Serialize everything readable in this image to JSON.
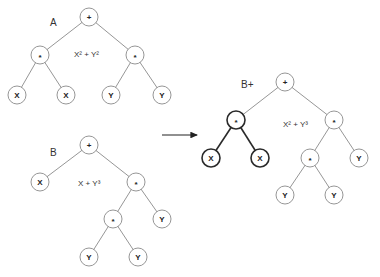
{
  "diagram": {
    "trees": [
      {
        "id": "A",
        "label": "A",
        "label_pos": [
          50,
          26
        ],
        "expression": "X² + Y²",
        "expression_pos": [
          74,
          57
        ],
        "nodes": [
          {
            "id": "a0",
            "text": "+",
            "x": 89,
            "y": 17,
            "bold": false
          },
          {
            "id": "a1",
            "text": "*",
            "x": 40,
            "y": 55,
            "bold": false
          },
          {
            "id": "a2",
            "text": "*",
            "x": 135,
            "y": 55,
            "bold": false
          },
          {
            "id": "a3",
            "text": "X",
            "x": 17,
            "y": 95,
            "bold": false
          },
          {
            "id": "a4",
            "text": "X",
            "x": 66,
            "y": 95,
            "bold": false
          },
          {
            "id": "a5",
            "text": "Y",
            "x": 111,
            "y": 95,
            "bold": false
          },
          {
            "id": "a6",
            "text": "Y",
            "x": 162,
            "y": 95,
            "bold": false
          }
        ],
        "edges": [
          [
            "a0",
            "a1",
            false
          ],
          [
            "a0",
            "a2",
            false
          ],
          [
            "a1",
            "a3",
            false
          ],
          [
            "a1",
            "a4",
            false
          ],
          [
            "a2",
            "a5",
            false
          ],
          [
            "a2",
            "a6",
            false
          ]
        ]
      },
      {
        "id": "B",
        "label": "B",
        "label_pos": [
          50,
          156
        ],
        "expression": "X + Y³",
        "expression_pos": [
          78,
          186
        ],
        "nodes": [
          {
            "id": "b0",
            "text": "+",
            "x": 89,
            "y": 145,
            "bold": false
          },
          {
            "id": "b1",
            "text": "X",
            "x": 40,
            "y": 182,
            "bold": false
          },
          {
            "id": "b2",
            "text": "*",
            "x": 136,
            "y": 182,
            "bold": false
          },
          {
            "id": "b3",
            "text": "*",
            "x": 113,
            "y": 219,
            "bold": false
          },
          {
            "id": "b4",
            "text": "Y",
            "x": 162,
            "y": 219,
            "bold": false
          },
          {
            "id": "b5",
            "text": "Y",
            "x": 89,
            "y": 257,
            "bold": false
          },
          {
            "id": "b6",
            "text": "Y",
            "x": 138,
            "y": 257,
            "bold": false
          }
        ],
        "edges": [
          [
            "b0",
            "b1",
            false
          ],
          [
            "b0",
            "b2",
            false
          ],
          [
            "b2",
            "b3",
            false
          ],
          [
            "b2",
            "b4",
            false
          ],
          [
            "b3",
            "b5",
            false
          ],
          [
            "b3",
            "b6",
            false
          ]
        ]
      },
      {
        "id": "Bplus",
        "label": "B+",
        "label_pos": [
          241,
          88
        ],
        "expression": "X² + Y³",
        "expression_pos": [
          283,
          127
        ],
        "nodes": [
          {
            "id": "p0",
            "text": "+",
            "x": 285,
            "y": 82,
            "bold": false
          },
          {
            "id": "p1",
            "text": "*",
            "x": 236,
            "y": 120,
            "bold": true
          },
          {
            "id": "p2",
            "text": "*",
            "x": 334,
            "y": 120,
            "bold": false
          },
          {
            "id": "p3",
            "text": "X",
            "x": 211,
            "y": 158,
            "bold": true
          },
          {
            "id": "p4",
            "text": "X",
            "x": 260,
            "y": 158,
            "bold": true
          },
          {
            "id": "p5",
            "text": "*",
            "x": 310,
            "y": 158,
            "bold": false
          },
          {
            "id": "p6",
            "text": "Y",
            "x": 359,
            "y": 158,
            "bold": false
          },
          {
            "id": "p7",
            "text": "Y",
            "x": 285,
            "y": 195,
            "bold": false
          },
          {
            "id": "p8",
            "text": "Y",
            "x": 334,
            "y": 195,
            "bold": false
          }
        ],
        "edges": [
          [
            "p0",
            "p1",
            false
          ],
          [
            "p0",
            "p2",
            false
          ],
          [
            "p1",
            "p3",
            true
          ],
          [
            "p1",
            "p4",
            true
          ],
          [
            "p2",
            "p5",
            false
          ],
          [
            "p2",
            "p6",
            false
          ],
          [
            "p5",
            "p7",
            false
          ],
          [
            "p5",
            "p8",
            false
          ]
        ]
      }
    ],
    "arrow": {
      "x1": 162,
      "y1": 135,
      "x2": 197,
      "y2": 135
    },
    "node_radius": 9
  }
}
